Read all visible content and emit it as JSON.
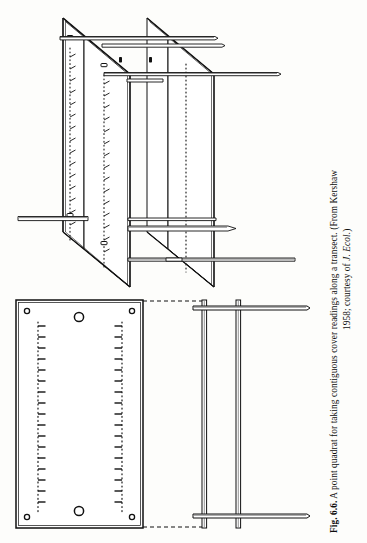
{
  "figure": {
    "label": "Fig. 6.6.",
    "caption_line_1": "A point quadrat for taking contiguous cover readings along a transect. (From Kershaw",
    "caption_line_2_prefix": "1958; courtesy of ",
    "caption_line_2_journal": "J. Ecol.",
    "caption_line_2_suffix": ")",
    "caption_full": "Fig. 6.6. A point quadrat for taking contiguous cover readings along a transect. (From Kershaw 1958; courtesy of J. Ecol.)"
  },
  "diagrams": {
    "perspective": {
      "name": "point-quadrat-perspective-view",
      "description": "Three-quarter perspective view of the point quadrat frame showing two upright scaled plates with sighting pins passed through them"
    },
    "plan_plate": {
      "name": "point-quadrat-plate-face-view",
      "description": "Flat face view of one upright plate showing corner bolt holes, two large pivot holes and two dotted vertical pin-hole scales"
    },
    "edge_frame": {
      "name": "point-quadrat-edge-view",
      "description": "Edge-on view of the quadrat frame showing the two upright legs and the horizontal cross pins"
    }
  },
  "plate": {
    "corner_holes": 4,
    "large_holes": 2,
    "scale_columns": 2,
    "ticks_per_scale": 17
  },
  "colors": {
    "ink": "#111111",
    "paper": "#fdfdfb",
    "shade": "#d8d8d8"
  }
}
